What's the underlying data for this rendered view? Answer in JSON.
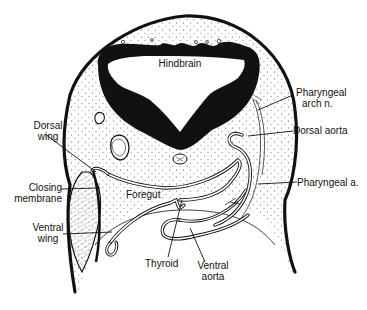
{
  "diagram": {
    "type": "anatomical cross-section line drawing",
    "labels": {
      "hindbrain": "Hindbrain",
      "pharyngeal_arch_n": [
        "Pharyngeal",
        "arch  n."
      ],
      "dorsal_aorta": "Dorsal aorta",
      "dorsal_wing": [
        "Dorsal",
        "wing"
      ],
      "closing_membrane": [
        "Closing",
        "membrane"
      ],
      "foregut": "Foregut",
      "pharyngeal_a": "Pharyngeal  a.",
      "ventral_wing": [
        "Ventral",
        "wing"
      ],
      "thyroid": "Thyroid",
      "ventral_aorta": [
        "Ventral",
        "aorta"
      ]
    },
    "colors": {
      "ink": "#111111",
      "paper": "#ffffff",
      "stipple": "#555555"
    }
  }
}
